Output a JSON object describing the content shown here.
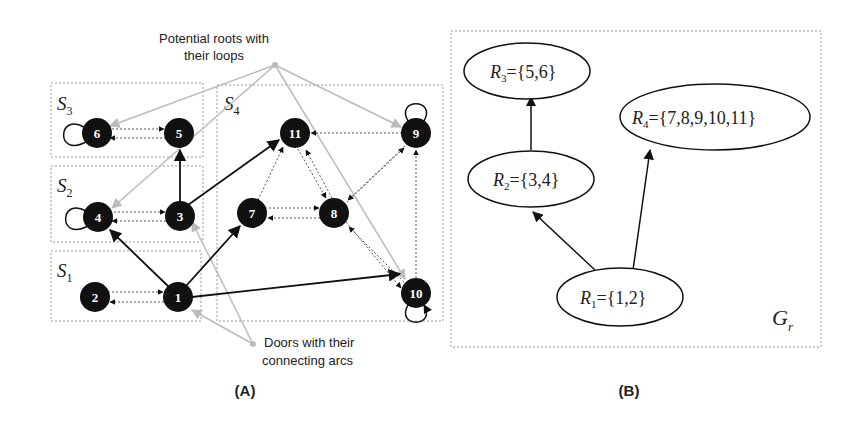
{
  "panel_a": {
    "label": "(A)",
    "annotation_roots_line1": "Potential roots with",
    "annotation_roots_line2": "their loops",
    "annotation_doors_line1": "Doors with their",
    "annotation_doors_line2": "connecting arcs",
    "subsets": [
      {
        "name": "S",
        "sub": "3"
      },
      {
        "name": "S",
        "sub": "2"
      },
      {
        "name": "S",
        "sub": "1"
      },
      {
        "name": "S",
        "sub": "4"
      }
    ],
    "nodes": [
      "1",
      "2",
      "3",
      "4",
      "5",
      "6",
      "7",
      "8",
      "9",
      "10",
      "11"
    ]
  },
  "panel_b": {
    "label": "(B)",
    "graph_name": "G",
    "graph_sub": "r",
    "regions": [
      {
        "name": "R",
        "sub": "3",
        "set": "={5,6}"
      },
      {
        "name": "R",
        "sub": "4",
        "set": "={7,8,9,10,11}"
      },
      {
        "name": "R",
        "sub": "2",
        "set": "={3,4}"
      },
      {
        "name": "R",
        "sub": "1",
        "set": "={1,2}"
      }
    ]
  }
}
